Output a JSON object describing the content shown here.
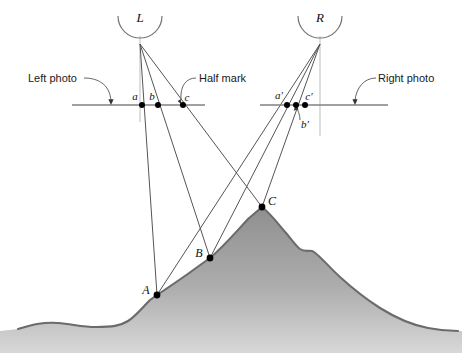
{
  "figure": {
    "background_color": "#ffffff",
    "line_color": "#555555",
    "terrain_color": "#9d9d9d",
    "terrain_outline_color": "#6b6b6b",
    "point_color": "#000000",
    "axis_color": "#c8c8c8"
  },
  "lenses": [
    {
      "id": "lens-left",
      "label": "L",
      "cx": 140,
      "cy": 22,
      "r": 22
    },
    {
      "id": "lens-right",
      "label": "R",
      "cx": 320,
      "cy": 22,
      "r": 22
    }
  ],
  "photo_lines": [
    {
      "id": "left-photo-line",
      "x1": 72,
      "x2": 205,
      "y": 105
    },
    {
      "id": "right-photo-line",
      "x1": 260,
      "x2": 388,
      "y": 105
    }
  ],
  "annotations": [
    {
      "id": "left-photo",
      "text": "Left photo",
      "x": 28,
      "y": 82
    },
    {
      "id": "half-mark",
      "text": "Half mark",
      "x": 199,
      "y": 82
    },
    {
      "id": "right-photo",
      "text": "Right photo",
      "x": 378,
      "y": 82
    }
  ],
  "image_points": [
    {
      "id": "point-a",
      "label": "a",
      "x": 142,
      "y": 105,
      "label_x": 135,
      "label_y": 100,
      "photo": "left"
    },
    {
      "id": "point-b",
      "label": "b",
      "x": 158,
      "y": 105,
      "label_x": 152,
      "label_y": 100,
      "photo": "left"
    },
    {
      "id": "point-c",
      "label": "c",
      "x": 183,
      "y": 105,
      "label_x": 184,
      "label_y": 101,
      "photo": "left"
    },
    {
      "id": "point-a-prime",
      "label": "a′",
      "x": 287,
      "y": 105,
      "label_x": 279,
      "label_y": 99,
      "photo": "right"
    },
    {
      "id": "point-b-prime",
      "label": "b′",
      "x": 296,
      "y": 105,
      "label_x": 303,
      "label_y": 126,
      "photo": "right"
    },
    {
      "id": "point-c-prime",
      "label": "c′",
      "x": 305,
      "y": 105,
      "label_x": 305,
      "label_y": 100,
      "photo": "right"
    }
  ],
  "ground_points": [
    {
      "id": "point-A",
      "label": "A",
      "x": 157,
      "y": 295,
      "label_x": 146,
      "label_y": 293
    },
    {
      "id": "point-B",
      "label": "B",
      "x": 210,
      "y": 258,
      "label_x": 199,
      "label_y": 256
    },
    {
      "id": "point-C",
      "label": "C",
      "x": 262,
      "y": 207,
      "label_x": 268,
      "label_y": 204
    }
  ],
  "rays": [
    {
      "id": "ray-L-A",
      "from": "L",
      "to": "A",
      "x1": 140,
      "y1": 44,
      "x2": 157,
      "y2": 295
    },
    {
      "id": "ray-L-B",
      "from": "L",
      "to": "B",
      "x1": 140,
      "y1": 44,
      "x2": 210,
      "y2": 258
    },
    {
      "id": "ray-L-C",
      "from": "L",
      "to": "C",
      "x1": 140,
      "y1": 44,
      "x2": 262,
      "y2": 207
    },
    {
      "id": "ray-R-A",
      "from": "R",
      "to": "A",
      "x1": 320,
      "y1": 44,
      "x2": 157,
      "y2": 295
    },
    {
      "id": "ray-R-B",
      "from": "R",
      "to": "B",
      "x1": 320,
      "y1": 44,
      "x2": 210,
      "y2": 258
    },
    {
      "id": "ray-R-C",
      "from": "R",
      "to": "C",
      "x1": 320,
      "y1": 44,
      "x2": 262,
      "y2": 207
    }
  ],
  "optical_axes": [
    {
      "id": "axis-left",
      "x": 140,
      "y1": 36,
      "y2": 122
    },
    {
      "id": "axis-right",
      "x": 320,
      "y1": 36,
      "y2": 136
    }
  ]
}
